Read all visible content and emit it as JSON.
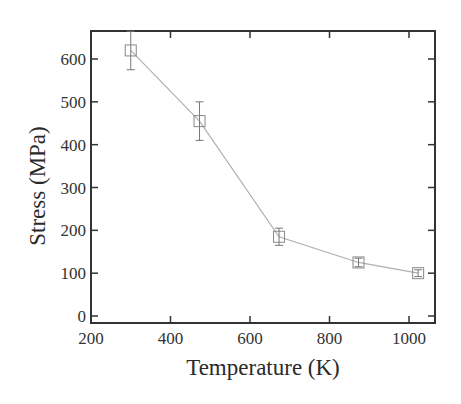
{
  "chart_data": {
    "type": "line",
    "title": "",
    "xlabel": "Temperature (K)",
    "ylabel": "Stress (MPa)",
    "xlim": [
      200,
      1060
    ],
    "ylim": [
      -15,
      665
    ],
    "xticks": [
      200,
      400,
      600,
      800,
      1000
    ],
    "yticks": [
      0,
      100,
      200,
      300,
      400,
      500,
      600
    ],
    "grid": false,
    "legend": null,
    "marker": "open-square",
    "series": [
      {
        "name": "Stress",
        "x": [
          300,
          473,
          673,
          873,
          1023
        ],
        "y": [
          620,
          455,
          185,
          125,
          100
        ],
        "yerr": [
          45,
          45,
          20,
          10,
          8
        ]
      }
    ]
  },
  "colors": {
    "axis": "#333333",
    "line": "#b0b0b0",
    "marker": "#888888",
    "errorbar": "#777777"
  }
}
